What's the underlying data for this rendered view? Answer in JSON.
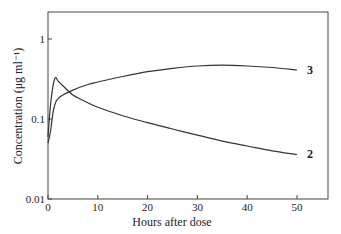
{
  "chart_data": {
    "type": "line",
    "title": "",
    "xlabel": "Hours after dose",
    "ylabel": "Concentration  (μg ml⁻¹)",
    "yscale": "log",
    "xlim": [
      0,
      56
    ],
    "ylim": [
      0.01,
      2.2
    ],
    "xticks": [
      0,
      10,
      20,
      30,
      40,
      50
    ],
    "xtick_labels": [
      "0",
      "10",
      "20",
      "30",
      "40",
      "50"
    ],
    "yticks": [
      0.01,
      0.1,
      1
    ],
    "ytick_labels": [
      "0.01",
      "0.1",
      "1"
    ],
    "grid": false,
    "legend": "inline labels at right end of curves",
    "series": [
      {
        "name": "2",
        "x": [
          0,
          0.5,
          1,
          1.5,
          2,
          3,
          5,
          8,
          10,
          15,
          20,
          25,
          30,
          35,
          40,
          45,
          50
        ],
        "values": [
          0.06,
          0.15,
          0.26,
          0.33,
          0.3,
          0.26,
          0.2,
          0.16,
          0.14,
          0.11,
          0.09,
          0.075,
          0.063,
          0.053,
          0.046,
          0.04,
          0.036
        ]
      },
      {
        "name": "3",
        "x": [
          0,
          0.5,
          1,
          1.5,
          2,
          3,
          5,
          8,
          10,
          15,
          20,
          25,
          30,
          35,
          40,
          45,
          50
        ],
        "values": [
          0.05,
          0.07,
          0.12,
          0.16,
          0.18,
          0.2,
          0.23,
          0.27,
          0.29,
          0.34,
          0.39,
          0.43,
          0.46,
          0.47,
          0.46,
          0.44,
          0.41
        ]
      }
    ]
  }
}
